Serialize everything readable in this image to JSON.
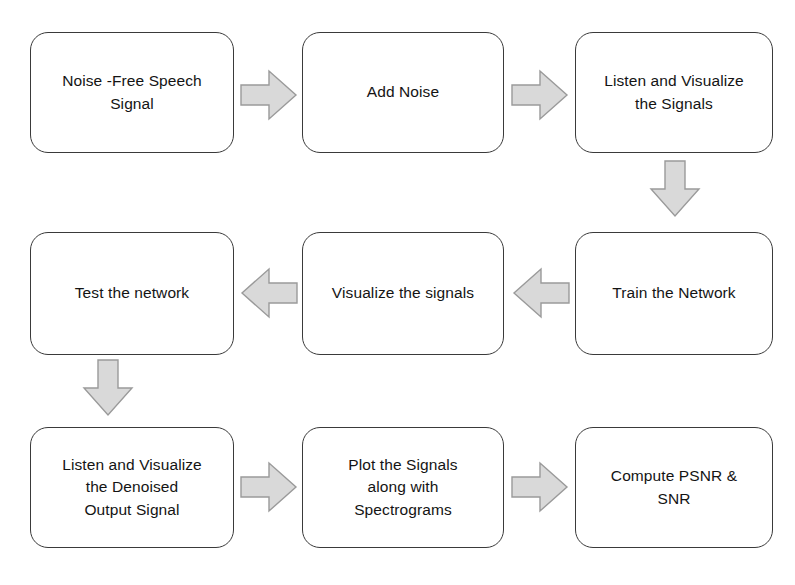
{
  "diagram": {
    "background_color": "#ffffff",
    "node_border_color": "#3a3a3a",
    "node_fill_color": "#ffffff",
    "arrow_fill_color": "#d9d9d9",
    "arrow_stroke_color": "#9a9a9a",
    "text_color": "#141414",
    "nodes": [
      {
        "id": "noise-free-speech-signal",
        "label": "Noise -Free Speech\nSignal",
        "row": 1,
        "column": 1,
        "x": 30,
        "y": 32,
        "width": 204,
        "height": 121
      },
      {
        "id": "add-noise",
        "label": "Add Noise",
        "row": 1,
        "column": 2,
        "x": 302,
        "y": 32,
        "width": 202,
        "height": 121
      },
      {
        "id": "listen-and-visualize-the-signals",
        "label": "Listen and Visualize\nthe Signals",
        "row": 1,
        "column": 3,
        "x": 575,
        "y": 32,
        "width": 198,
        "height": 121
      },
      {
        "id": "test-the-network",
        "label": "Test the network",
        "row": 2,
        "column": 1,
        "x": 30,
        "y": 232,
        "width": 204,
        "height": 123
      },
      {
        "id": "visualize-the-signals",
        "label": "Visualize the signals",
        "row": 2,
        "column": 2,
        "x": 302,
        "y": 232,
        "width": 202,
        "height": 123
      },
      {
        "id": "train-the-network",
        "label": "Train the Network",
        "row": 2,
        "column": 3,
        "x": 575,
        "y": 232,
        "width": 198,
        "height": 123
      },
      {
        "id": "listen-and-visualize-the-denoised-output-signal",
        "label": "Listen and Visualize\nthe Denoised\nOutput Signal",
        "row": 3,
        "column": 1,
        "x": 30,
        "y": 427,
        "width": 204,
        "height": 121
      },
      {
        "id": "plot-the-signals-along-with-spectrograms",
        "label": "Plot the Signals\nalong with\nSpectrograms",
        "row": 3,
        "column": 2,
        "x": 302,
        "y": 427,
        "width": 202,
        "height": 121
      },
      {
        "id": "compute-psnr-and-snr",
        "label": "Compute PSNR &\nSNR",
        "row": 3,
        "column": 3,
        "x": 575,
        "y": 427,
        "width": 198,
        "height": 121
      }
    ],
    "connectors": [
      {
        "id": "noise-free-speech-signal-to-add-noise",
        "direction": "right",
        "from": "noise-free-speech-signal",
        "to": "add-noise",
        "x": 241,
        "y": 71,
        "width": 55,
        "height": 48
      },
      {
        "id": "add-noise-to-listen-and-visualize-the-signals",
        "direction": "right",
        "from": "add-noise",
        "to": "listen-and-visualize-the-signals",
        "x": 512,
        "y": 71,
        "width": 55,
        "height": 48
      },
      {
        "id": "listen-and-visualize-the-signals-to-train-the-network",
        "direction": "down",
        "from": "listen-and-visualize-the-signals",
        "to": "train-the-network",
        "x": 651,
        "y": 161,
        "width": 48,
        "height": 55
      },
      {
        "id": "train-the-network-to-visualize-the-signals",
        "direction": "left",
        "from": "train-the-network",
        "to": "visualize-the-signals",
        "x": 514,
        "y": 269,
        "width": 55,
        "height": 48
      },
      {
        "id": "visualize-the-signals-to-test-the-network",
        "direction": "left",
        "from": "visualize-the-signals",
        "to": "test-the-network",
        "x": 242,
        "y": 269,
        "width": 55,
        "height": 48
      },
      {
        "id": "test-the-network-to-listen-and-visualize-the-denoised-output-signal",
        "direction": "down",
        "from": "test-the-network",
        "to": "listen-and-visualize-the-denoised-output-signal",
        "x": 84,
        "y": 360,
        "width": 48,
        "height": 55
      },
      {
        "id": "listen-and-visualize-the-denoised-output-signal-to-plot-the-signals",
        "direction": "right",
        "from": "listen-and-visualize-the-denoised-output-signal",
        "to": "plot-the-signals-along-with-spectrograms",
        "x": 241,
        "y": 463,
        "width": 55,
        "height": 48
      },
      {
        "id": "plot-the-signals-to-compute-psnr-and-snr",
        "direction": "right",
        "from": "plot-the-signals-along-with-spectrograms",
        "to": "compute-psnr-and-snr",
        "x": 512,
        "y": 463,
        "width": 55,
        "height": 48
      }
    ]
  }
}
